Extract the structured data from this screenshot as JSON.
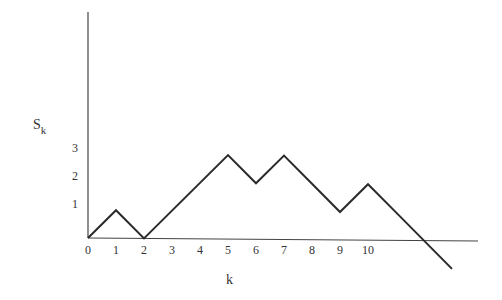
{
  "chart_data": {
    "type": "line",
    "title": "",
    "xlabel": "k",
    "ylabel": "S",
    "ylabel_subscript": "k",
    "x": [
      0,
      1,
      2,
      3,
      4,
      5,
      6,
      7,
      8,
      9,
      10,
      11,
      12,
      13
    ],
    "series": [
      {
        "name": "S_k",
        "values": [
          0,
          1,
          0,
          1,
          2,
          3,
          2,
          3,
          2,
          1,
          2,
          1,
          0,
          -1
        ]
      }
    ],
    "x_tick_labels": [
      "0",
      "1",
      "2",
      "3",
      "4",
      "5",
      "6",
      "7",
      "8",
      "9",
      "10"
    ],
    "y_tick_labels": [
      "1",
      "2",
      "3"
    ],
    "xlim": [
      0,
      14
    ],
    "ylim": [
      -1,
      7
    ],
    "grid": false,
    "legend": null,
    "colors": {
      "line": "#2a2a2a",
      "axis": "#444444",
      "text": "#333333"
    }
  }
}
